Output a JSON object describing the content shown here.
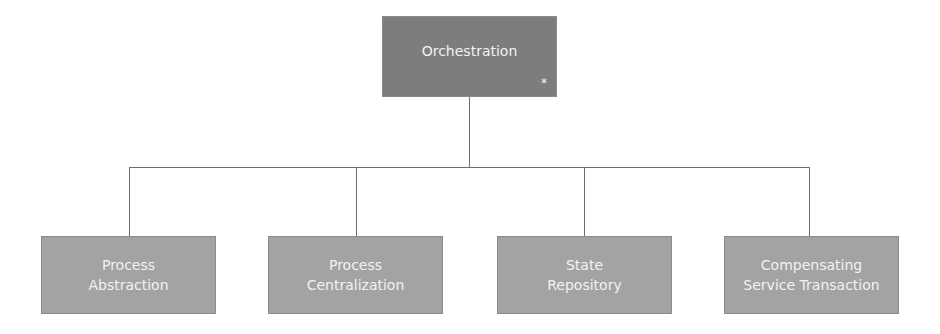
{
  "diagram": {
    "type": "hierarchy",
    "root": {
      "label": "Orchestration",
      "marker": "*"
    },
    "children": [
      {
        "label": "Process\nAbstraction"
      },
      {
        "label": "Process\nCentralization"
      },
      {
        "label": "State\nRepository"
      },
      {
        "label": "Compensating\nService Transaction"
      }
    ],
    "colors": {
      "root_fill": "#7d7d7d",
      "child_fill": "#a3a3a3",
      "connector": "#6e6e6e",
      "text": "#f2f2f2"
    }
  }
}
